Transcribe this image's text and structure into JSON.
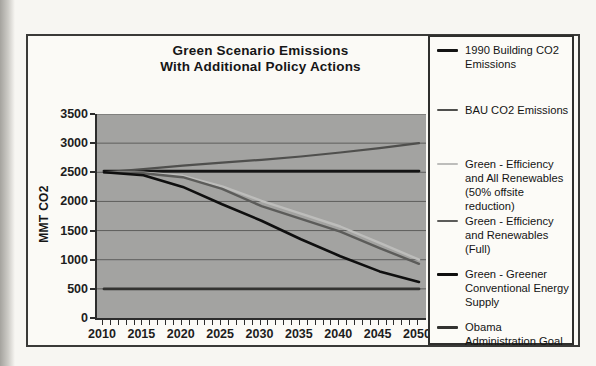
{
  "title": {
    "line1": "Green Scenario Emissions",
    "line2": "With Additional Policy Actions"
  },
  "y_axis": {
    "label": "MMT CO2",
    "tick_values": [
      0,
      500,
      1000,
      1500,
      2000,
      2500,
      3000,
      3500
    ]
  },
  "x_axis": {
    "tick_labels": [
      "2010",
      "2015",
      "2020",
      "2025",
      "2030",
      "2035",
      "2040",
      "2045",
      "2050"
    ],
    "minor_tick_step_years": 1
  },
  "legend": {
    "entries": [
      {
        "label": "1990 Building CO2 Emissions"
      },
      {
        "label": "BAU CO2 Emissions"
      },
      {
        "label": "Green - Efficiency and All Renewables (50% offsite reduction)"
      },
      {
        "label": "Green - Efficiency and Renewables (Full)"
      },
      {
        "label": "Green - Greener Conventional Energy Supply"
      },
      {
        "label": "Obama Administration Goal"
      }
    ]
  },
  "colors": {
    "plot_background": "#a3a3a1",
    "gridline": "#5e5e5c",
    "axis": "#2c2c2c",
    "page_background": "#f7f6f2"
  },
  "chart_data": {
    "type": "line",
    "title": "Green Scenario Emissions With Additional Policy Actions",
    "xlabel": "",
    "ylabel": "MMT CO2",
    "xlim": [
      2010,
      2050
    ],
    "ylim": [
      0,
      3500
    ],
    "grid": true,
    "legend_position": "right",
    "x": [
      2010,
      2015,
      2020,
      2025,
      2030,
      2035,
      2040,
      2045,
      2050
    ],
    "series": [
      {
        "name": "1990 Building CO2 Emissions",
        "color": "#141414",
        "stroke_width": 2.8,
        "values": [
          2520,
          2520,
          2520,
          2520,
          2520,
          2520,
          2520,
          2520,
          2520
        ]
      },
      {
        "name": "BAU CO2 Emissions",
        "color": "#4f4f4d",
        "stroke_width": 2.2,
        "values": [
          2500,
          2555,
          2615,
          2665,
          2715,
          2770,
          2840,
          2915,
          3000
        ]
      },
      {
        "name": "Green - Efficiency and All Renewables (50% offsite reduction)",
        "color": "#bdbdbb",
        "stroke_width": 2.4,
        "values": [
          2500,
          2495,
          2440,
          2260,
          2010,
          1790,
          1570,
          1290,
          1000
        ]
      },
      {
        "name": "Green - Efficiency and Renewables (Full)",
        "color": "#5c5c5a",
        "stroke_width": 2.4,
        "values": [
          2500,
          2485,
          2415,
          2215,
          1920,
          1700,
          1480,
          1200,
          930
        ]
      },
      {
        "name": "Green - Greener Conventional Energy Supply",
        "color": "#0f0f0f",
        "stroke_width": 2.6,
        "values": [
          2500,
          2450,
          2250,
          1950,
          1670,
          1350,
          1060,
          800,
          620
        ]
      },
      {
        "name": "Obama Administration Goal",
        "color": "#333331",
        "stroke_width": 2.8,
        "values": [
          500,
          500,
          500,
          500,
          500,
          500,
          500,
          500,
          500
        ]
      }
    ]
  }
}
